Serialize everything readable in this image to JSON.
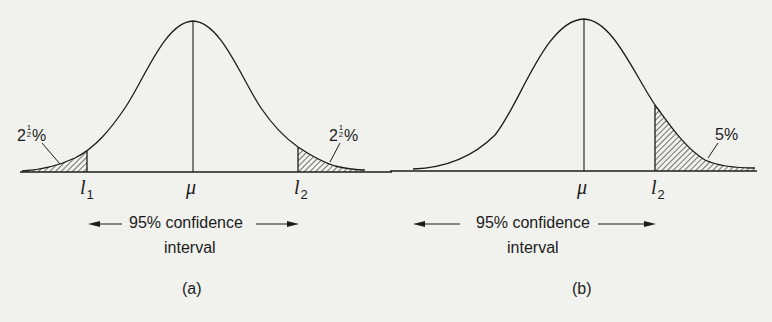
{
  "figure": {
    "panels": [
      {
        "id": "a",
        "caption": "(a)",
        "center_label": "μ",
        "lower_limit": {
          "symbol": "l",
          "subscript": "1"
        },
        "upper_limit": {
          "symbol": "l",
          "subscript": "2"
        },
        "left_tail": {
          "whole": "2",
          "num": "1",
          "den": "2",
          "unit": "%"
        },
        "right_tail": {
          "whole": "2",
          "num": "1",
          "den": "2",
          "unit": "%"
        },
        "interval_label_line1": "95% confidence",
        "interval_label_line2": "interval"
      },
      {
        "id": "b",
        "caption": "(b)",
        "center_label": "μ",
        "upper_limit": {
          "symbol": "l",
          "subscript": "2"
        },
        "right_tail": {
          "text": "5%"
        },
        "interval_label_line1": "95% confidence",
        "interval_label_line2": "interval"
      }
    ]
  },
  "colors": {
    "background": "#f1f1ee",
    "ink": "#1c1c1c"
  }
}
